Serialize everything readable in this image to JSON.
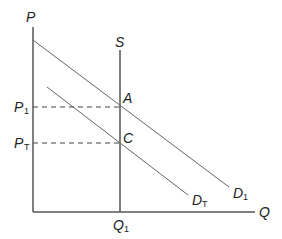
{
  "diagram": {
    "type": "supply-demand",
    "axes": {
      "y_label": "P",
      "x_label": "Q"
    },
    "curves": {
      "supply": {
        "label": "S"
      },
      "demand_1": {
        "label": "D",
        "subscript": "1"
      },
      "demand_T": {
        "label": "D",
        "subscript": "T"
      }
    },
    "points": {
      "a": {
        "label": "A"
      },
      "c": {
        "label": "C"
      }
    },
    "price_levels": {
      "p1": {
        "label": "P",
        "subscript": "1"
      },
      "pT": {
        "label": "P",
        "subscript": "T"
      }
    },
    "quantity_levels": {
      "q1": {
        "label": "Q",
        "subscript": "1"
      }
    },
    "colors": {
      "axis": "#555555",
      "curve": "#666666",
      "text": "#222222"
    }
  }
}
